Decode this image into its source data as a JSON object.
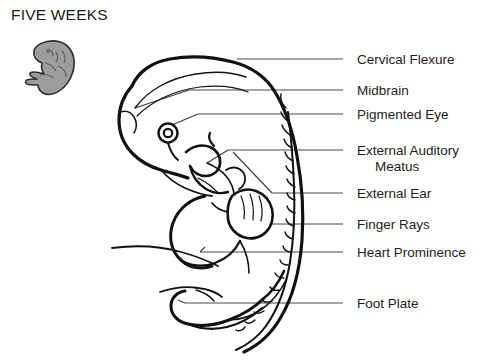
{
  "title": "FIVE WEEKS",
  "colors": {
    "ink": "#1a1a1a",
    "background": "#ffffff",
    "thumbnail_fill": "#9a9a9a",
    "thumbnail_outline": "#2b2b2b",
    "leader_line": "#4a4a4a"
  },
  "thumbnail": {
    "name": "five-week-embryo-thumbnail",
    "description": "small grey shaded embryo silhouette"
  },
  "figure": {
    "name": "five-week-embryo-diagram"
  },
  "labels": [
    {
      "id": "cervical-flexure",
      "text": "Cervical Flexure",
      "line2": "",
      "text_x": 357,
      "text_y": 52,
      "leader": {
        "x1": 343,
        "y1": 59,
        "x2": 237,
        "y2": 59
      }
    },
    {
      "id": "midbrain",
      "text": "Midbrain",
      "line2": "",
      "text_x": 357,
      "text_y": 83,
      "leader": {
        "x1": 343,
        "y1": 90,
        "x2": 189,
        "y2": 90
      }
    },
    {
      "id": "pigmented-eye",
      "text": "Pigmented Eye",
      "line2": "",
      "text_x": 357,
      "text_y": 107,
      "leader": {
        "x1": 343,
        "y1": 114,
        "x2": 198,
        "y2": 114
      }
    },
    {
      "id": "external-auditory-meatus",
      "text": "External Auditory",
      "line2": "Meatus",
      "text_x": 357,
      "text_y": 143,
      "leader": {
        "x1": 343,
        "y1": 150,
        "x2": 228,
        "y2": 150
      }
    },
    {
      "id": "external-ear",
      "text": "External Ear",
      "line2": "",
      "text_x": 357,
      "text_y": 186,
      "leader": {
        "x1": 343,
        "y1": 193,
        "x2": 272,
        "y2": 193
      }
    },
    {
      "id": "finger-rays",
      "text": "Finger Rays",
      "line2": "",
      "text_x": 357,
      "text_y": 217,
      "leader": {
        "x1": 343,
        "y1": 224,
        "x2": 272,
        "y2": 224
      }
    },
    {
      "id": "heart-prominence",
      "text": "Heart Prominence",
      "line2": "",
      "text_x": 357,
      "text_y": 245,
      "leader": {
        "x1": 343,
        "y1": 252,
        "x2": 200,
        "y2": 252
      }
    },
    {
      "id": "foot-plate",
      "text": "Foot Plate",
      "line2": "",
      "text_x": 357,
      "text_y": 296,
      "leader": {
        "x1": 343,
        "y1": 303,
        "x2": 185,
        "y2": 303
      }
    }
  ]
}
